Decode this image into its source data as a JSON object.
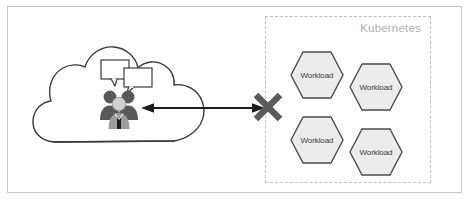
{
  "diagram": {
    "title_label": "",
    "cloud": {
      "name": "cloud-shape",
      "people_icon": "people-group-icon",
      "speech_bubble_left": "speech-bubble-icon",
      "speech_bubble_right": "speech-bubble-icon"
    },
    "connector": {
      "arrow": "double-headed-arrow",
      "blocked_marker": "x-cross-icon",
      "blocked_marker_glyph": "✕"
    },
    "kubernetes_zone": {
      "label": "Kubernetes",
      "border_style": "dashed",
      "workloads": [
        {
          "label": "Workload",
          "x": 289,
          "y": 50,
          "w": 56,
          "h": 50
        },
        {
          "label": "Workload",
          "x": 348,
          "y": 62,
          "w": 56,
          "h": 50
        },
        {
          "label": "Workload",
          "x": 289,
          "y": 115,
          "w": 56,
          "h": 50
        },
        {
          "label": "Workload",
          "x": 348,
          "y": 127,
          "w": 56,
          "h": 50
        }
      ]
    }
  },
  "colors": {
    "frame_border": "#c9c9c9",
    "dashed_border": "#c2c2c2",
    "zone_label": "#b0b0b0",
    "cloud_stroke": "#3a3a3a",
    "hex_fill": "#ececec",
    "hex_stroke": "#4a4a4a",
    "arrow": "#1e1e1e",
    "cross": "#5a5a5a",
    "person_dark": "#595959",
    "person_light": "#c9c9c9",
    "text": "#3c3c3c"
  }
}
